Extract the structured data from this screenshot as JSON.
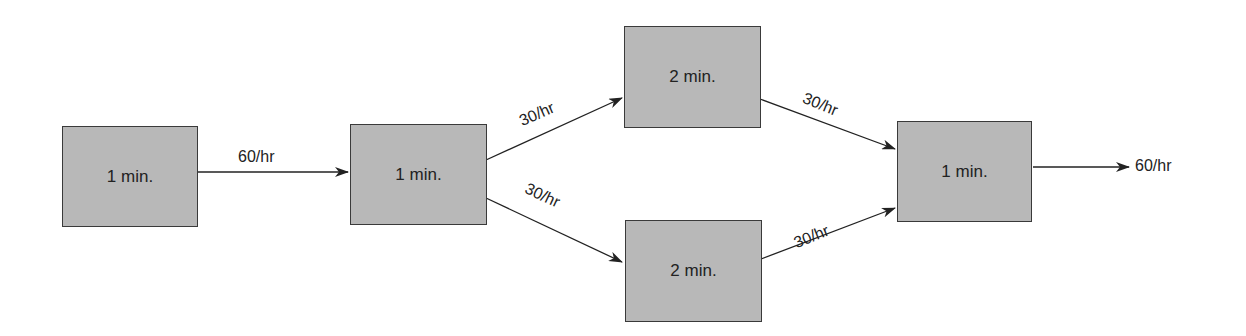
{
  "diagram": {
    "type": "process-flow",
    "stations": [
      {
        "id": "s1",
        "label": "1 min."
      },
      {
        "id": "s2",
        "label": "1 min."
      },
      {
        "id": "s3",
        "label": "2 min."
      },
      {
        "id": "s4",
        "label": "2 min."
      },
      {
        "id": "s5",
        "label": "1 min."
      }
    ],
    "flows": [
      {
        "from": "s1",
        "to": "s2",
        "label": "60/hr"
      },
      {
        "from": "s2",
        "to": "s3",
        "label": "30/hr"
      },
      {
        "from": "s2",
        "to": "s4",
        "label": "30/hr"
      },
      {
        "from": "s3",
        "to": "s5",
        "label": "30/hr"
      },
      {
        "from": "s4",
        "to": "s5",
        "label": "30/hr"
      },
      {
        "from": "s5",
        "to": "output",
        "label": "60/hr"
      }
    ],
    "colors": {
      "box_fill": "#b8b8b8",
      "box_border": "#3a3a3a",
      "line": "#222222"
    }
  }
}
